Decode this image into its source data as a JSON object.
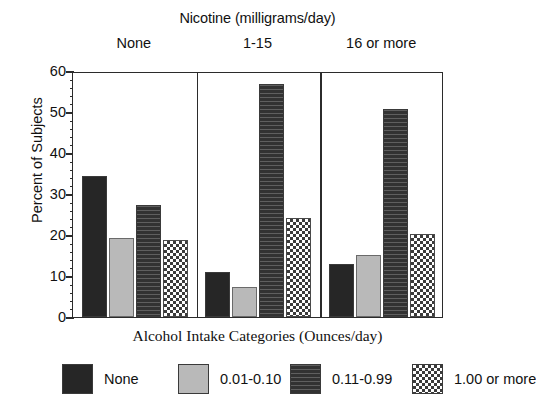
{
  "chart_data": {
    "type": "bar",
    "title": "Nicotine (milligrams/day)",
    "xlabel": "Alcohol Intake Categories (Ounces/day)",
    "ylabel": "Percent of Subjects",
    "ylim": [
      0,
      60
    ],
    "ytick_labels": [
      "0",
      "10",
      "20",
      "30",
      "40",
      "50",
      "60"
    ],
    "ytick_values": [
      0,
      10,
      20,
      30,
      40,
      50,
      60
    ],
    "minor_tick_step": 2,
    "grid": false,
    "legend_position": "bottom",
    "panels": true,
    "categories": [
      "None",
      "1-15",
      "16 or more"
    ],
    "series": [
      {
        "name": "None",
        "pattern": "solid-dark",
        "values": [
          34.5,
          10.9,
          12.9
        ]
      },
      {
        "name": "0.01-0.10",
        "pattern": "light-gray",
        "values": [
          19.2,
          7.2,
          15.2
        ]
      },
      {
        "name": "0.11-0.99",
        "pattern": "hlines-dark",
        "values": [
          27.4,
          56.9,
          50.8
        ]
      },
      {
        "name": "1.00 or more",
        "pattern": "checker",
        "values": [
          18.8,
          24.2,
          20.3
        ]
      }
    ]
  },
  "chart": {
    "top_title": "Nicotine (milligrams/day)",
    "y_axis_title": "Percent of Subjects",
    "x_axis_title": "Alcohol Intake Categories (Ounces/day)",
    "group_labels": [
      "None",
      "1-15",
      "16 or more"
    ],
    "y_ticks": [
      "60",
      "50",
      "40",
      "30",
      "20",
      "10",
      "0"
    ]
  },
  "legend": {
    "items": [
      {
        "label": "None",
        "pattern": "solid-dark"
      },
      {
        "label": "0.01-0.10",
        "pattern": "light-gray"
      },
      {
        "label": "0.11-0.99",
        "pattern": "hlines-dark"
      },
      {
        "label": "1.00 or more",
        "pattern": "checker"
      }
    ]
  },
  "colors": {
    "solid_dark": "#262626",
    "light_gray": "#b9b9b9",
    "hlines_dark": "#323232",
    "checker_dark": "#3b3b3b",
    "axis": "#2b2b2b",
    "background": "#ffffff"
  }
}
